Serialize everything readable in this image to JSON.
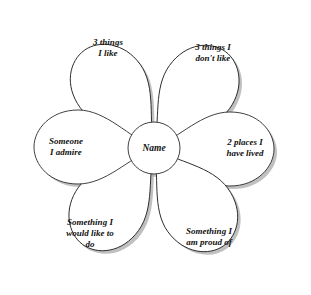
{
  "diagram": {
    "background_color": "#ffffff",
    "outline_color": "#2b2b2b",
    "shadow_color": "#a8a8a8",
    "center": {
      "label": "Name",
      "cx": 154,
      "cy": 148,
      "r": 26
    },
    "petals": [
      {
        "id": "top-left",
        "label": "3 things\nI like",
        "angle": -126,
        "label_x": 108,
        "label_y": 48
      },
      {
        "id": "top-right",
        "label": "3 things I\ndon't like",
        "angle": -54,
        "label_x": 213,
        "label_y": 53
      },
      {
        "id": "right",
        "label": "2 places I\nhave lived",
        "angle": 0,
        "label_x": 245,
        "label_y": 148
      },
      {
        "id": "bottom-right",
        "label": "Something I\nam proud of",
        "angle": 54,
        "label_x": 209,
        "label_y": 237
      },
      {
        "id": "bottom-left",
        "label": "Something I\nwould like to\ndo",
        "angle": 126,
        "label_x": 90,
        "label_y": 233
      },
      {
        "id": "left",
        "label": "Someone\nI admire",
        "angle": 180,
        "label_x": 66,
        "label_y": 147
      }
    ]
  }
}
